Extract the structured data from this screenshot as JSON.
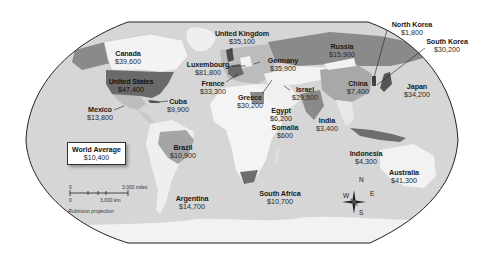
{
  "map": {
    "projection": "Robinson projection",
    "colors": {
      "ocean": "#d9d9d9",
      "land_light": "#f4f4f4",
      "land_mid": "#a8a8a8",
      "land_dark": "#6e6e6e",
      "border": "#222222"
    },
    "legend": {
      "title": "World Average",
      "value": "$10,400"
    },
    "scale_bar": {
      "miles_zero": "0",
      "miles_label": "3,000 miles",
      "km_zero": "0",
      "km_label": "3,000 km"
    },
    "compass": {
      "n": "N",
      "s": "S",
      "e": "E",
      "w": "W"
    },
    "countries": [
      {
        "name": "Canada",
        "value": "$39,600"
      },
      {
        "name": "United States",
        "value": "$47,400"
      },
      {
        "name": "Mexico",
        "value": "$13,800"
      },
      {
        "name": "Cuba",
        "value": "$9,900"
      },
      {
        "name": "United Kingdom",
        "value": "$35,100"
      },
      {
        "name": "Luxembourg",
        "value": "$81,800"
      },
      {
        "name": "France",
        "value": "$33,300"
      },
      {
        "name": "Germany",
        "value": "$35,900"
      },
      {
        "name": "Greece",
        "value": "$30,200"
      },
      {
        "name": "Israel",
        "value": "$29,500"
      },
      {
        "name": "Egypt",
        "value": "$6,200"
      },
      {
        "name": "Somalia",
        "value": "$600"
      },
      {
        "name": "Russia",
        "value": "$15,900"
      },
      {
        "name": "China",
        "value": "$7,400"
      },
      {
        "name": "India",
        "value": "$3,400"
      },
      {
        "name": "North Korea",
        "value": "$1,800"
      },
      {
        "name": "South Korea",
        "value": "$30,200"
      },
      {
        "name": "Japan",
        "value": "$34,200"
      },
      {
        "name": "Indonesia",
        "value": "$4,300"
      },
      {
        "name": "Australia",
        "value": "$41,300"
      },
      {
        "name": "Brazil",
        "value": "$10,900"
      },
      {
        "name": "Argentina",
        "value": "$14,700"
      },
      {
        "name": "South Africa",
        "value": "$10,700"
      }
    ]
  }
}
